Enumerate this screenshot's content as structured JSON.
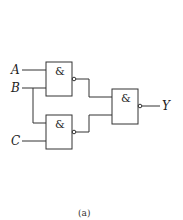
{
  "diagram": {
    "type": "logic-circuit",
    "inputs": [
      "A",
      "B",
      "C"
    ],
    "output": "Y",
    "gates": [
      {
        "id": "g1",
        "symbol": "&",
        "kind": "NAND",
        "inputs": [
          "A",
          "B"
        ]
      },
      {
        "id": "g2",
        "symbol": "&",
        "kind": "NAND",
        "inputs": [
          "B",
          "C"
        ]
      },
      {
        "id": "g3",
        "symbol": "&",
        "kind": "NAND",
        "inputs": [
          "g1",
          "g2"
        ]
      }
    ],
    "caption": "(a)"
  },
  "labels": {
    "a": "A",
    "b": "B",
    "c": "C",
    "y": "Y",
    "g1": "&",
    "g2": "&",
    "g3": "&",
    "caption": "(a)"
  }
}
